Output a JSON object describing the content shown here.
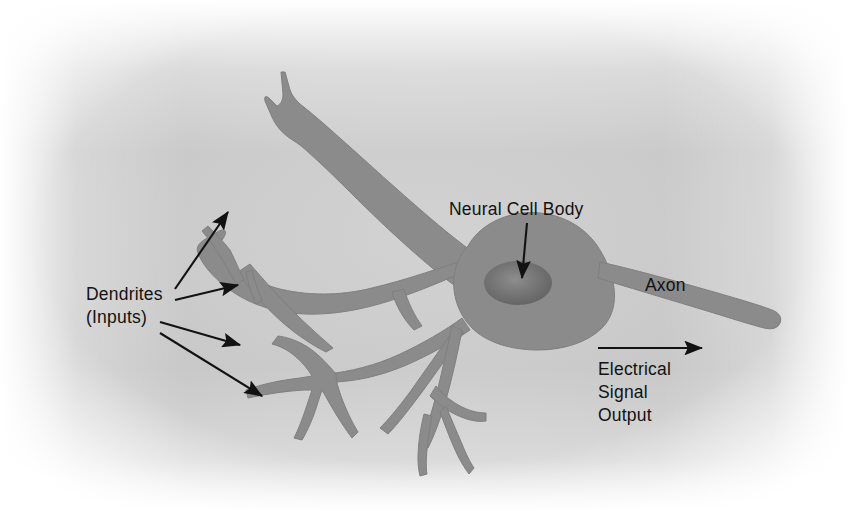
{
  "figure": {
    "background_center_color": "#c9c9c9",
    "background_edge_color": "#ffffff",
    "neuron_color": "#8b8b8b",
    "neuron_outline_color": "#7d7d7d",
    "nucleus_color": "#6f6f6f",
    "annotation_color": "#121212"
  },
  "labels": {
    "dendrites_line1": "Dendrites",
    "dendrites_line2": "(Inputs)",
    "neural_cell_body": "Neural Cell Body",
    "axon": "Axon",
    "signal_line1": "Electrical",
    "signal_line2": "Signal",
    "signal_line3": "Output"
  },
  "parts": [
    {
      "name": "dendrites",
      "label": "Dendrites (Inputs)",
      "pointer_count": 4
    },
    {
      "name": "soma",
      "label": "Neural Cell Body",
      "pointer_count": 1
    },
    {
      "name": "axon",
      "label": "Axon",
      "pointer_count": 0
    },
    {
      "name": "signal-direction",
      "label": "Electrical Signal Output",
      "pointer_count": 1
    }
  ]
}
